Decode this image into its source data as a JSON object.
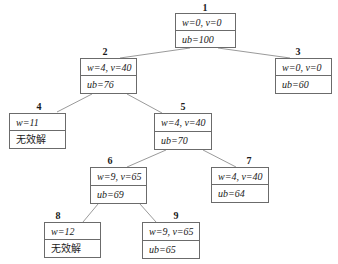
{
  "diagram": {
    "type": "branch-and-bound search tree",
    "edge_color": "#9a9a9a",
    "border_color": "#6b6b6b",
    "nodes": [
      {
        "id": "1",
        "label": "1",
        "line1": "w=0, v=0",
        "line2": "ub=100",
        "x": 175,
        "y": 13,
        "w": 61,
        "h": 35,
        "parent": null
      },
      {
        "id": "2",
        "label": "2",
        "line1": "w=4, v=40",
        "line2": "ub=76",
        "x": 80,
        "y": 58,
        "w": 57,
        "h": 36,
        "parent": "1"
      },
      {
        "id": "3",
        "label": "3",
        "line1": "w=0, v=0",
        "line2": "ub=60",
        "x": 275,
        "y": 58,
        "w": 57,
        "h": 36,
        "parent": "1"
      },
      {
        "id": "4",
        "label": "4",
        "line1": "w=11",
        "line2": "无效解",
        "x": 9,
        "y": 113,
        "w": 57,
        "h": 36,
        "parent": "2"
      },
      {
        "id": "5",
        "label": "5",
        "line1": "w=4, v=40",
        "line2": "ub=70",
        "x": 154,
        "y": 113,
        "w": 58,
        "h": 37,
        "parent": "2"
      },
      {
        "id": "6",
        "label": "6",
        "line1": "w=9, v=65",
        "line2": "ub=69",
        "x": 90,
        "y": 167,
        "w": 57,
        "h": 37,
        "parent": "5"
      },
      {
        "id": "7",
        "label": "7",
        "line1": "w=4, v=40",
        "line2": "ub=64",
        "x": 211,
        "y": 167,
        "w": 58,
        "h": 36,
        "parent": "5"
      },
      {
        "id": "8",
        "label": "8",
        "line1": "w=12",
        "line2": "无效解",
        "x": 44,
        "y": 222,
        "w": 57,
        "h": 36,
        "parent": "6"
      },
      {
        "id": "9",
        "label": "9",
        "line1": "w=9, v=65",
        "line2": "ub=65",
        "x": 142,
        "y": 222,
        "w": 58,
        "h": 37,
        "parent": "6"
      }
    ]
  }
}
